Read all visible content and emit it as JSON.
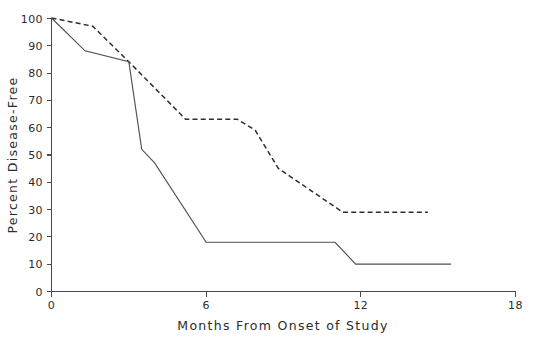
{
  "chart_data": {
    "type": "line",
    "title": "",
    "xlabel": "Months From Onset of Study",
    "ylabel": "Percent Disease-Free",
    "xlim": [
      0,
      18
    ],
    "ylim": [
      0,
      100
    ],
    "grid": false,
    "legend": "none",
    "xticks": [
      0,
      6,
      12,
      18
    ],
    "xtick_labels": [
      "0",
      "6",
      "12",
      "18"
    ],
    "yticks": [
      0,
      10,
      20,
      30,
      40,
      50,
      60,
      70,
      80,
      90,
      100
    ],
    "ytick_labels": [
      "0",
      "10",
      "20",
      "30",
      "40",
      "50",
      "60",
      "70",
      "80",
      "90",
      "100"
    ],
    "series": [
      {
        "name": "dashed-curve",
        "style": "dashed",
        "color": "#2e2e2e",
        "x": [
          0.0,
          1.6,
          3.0,
          5.2,
          7.2,
          7.9,
          8.8,
          11.3,
          14.6
        ],
        "y": [
          100,
          97,
          84,
          63,
          63,
          59,
          45,
          29,
          29
        ]
      },
      {
        "name": "solid-curve",
        "style": "solid",
        "color": "#4f4f4f",
        "x": [
          0.0,
          1.3,
          3.0,
          3.5,
          4.0,
          6.0,
          11.0,
          11.8,
          15.5
        ],
        "y": [
          100,
          88,
          84,
          52,
          47,
          18,
          18,
          10,
          10
        ]
      }
    ]
  },
  "axes": {
    "y_title": "Percent Disease-Free",
    "x_title": "Months From Onset of Study"
  }
}
